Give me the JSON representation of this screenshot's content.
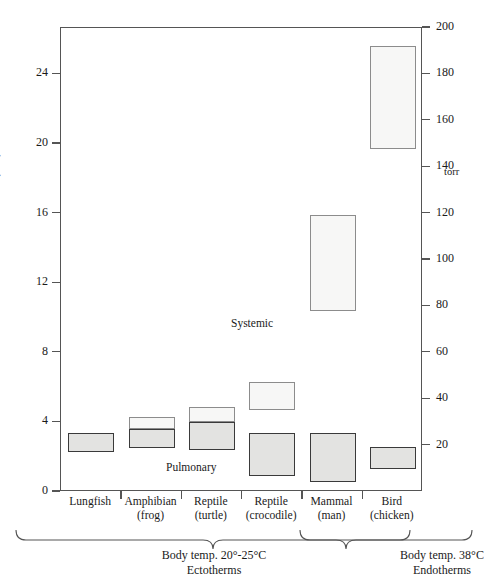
{
  "chart_data": {
    "type": "bar",
    "title": "",
    "ylabel": "Pressure (kPa)",
    "y2label": "torr",
    "xlabel": "",
    "ylim": [
      0,
      26.66
    ],
    "y2lim": [
      0,
      200
    ],
    "yticks": [
      0,
      4,
      8,
      12,
      16,
      20,
      24
    ],
    "y2ticks": [
      20,
      40,
      60,
      80,
      100,
      120,
      140,
      160,
      180,
      200
    ],
    "grid": false,
    "legend_position": "in-plot annotations",
    "annotations": [
      "Systemic",
      "Pulmonary"
    ],
    "categories": [
      "Lungfish",
      "Amphibian (frog)",
      "Reptile (turtle)",
      "Reptile (crocodile)",
      "Mammal (man)",
      "Bird (chicken)"
    ],
    "series": [
      {
        "name": "Pulmonary",
        "unit": "kPa",
        "ranges": [
          [
            2.3,
            3.4
          ],
          [
            2.5,
            3.6
          ],
          [
            2.4,
            4.0
          ],
          [
            0.9,
            3.4
          ],
          [
            0.6,
            3.4
          ],
          [
            1.3,
            2.6
          ]
        ]
      },
      {
        "name": "Systemic",
        "unit": "kPa",
        "ranges": [
          null,
          [
            3.6,
            4.3
          ],
          [
            4.0,
            4.9
          ],
          [
            4.7,
            6.3
          ],
          [
            10.4,
            15.9
          ],
          [
            19.7,
            25.6
          ]
        ]
      }
    ],
    "groups": [
      {
        "label_line1": "Body temp. 20°-25°C",
        "label_line2": "Ectotherms",
        "categories": [
          "Lungfish",
          "Amphibian (frog)",
          "Reptile (turtle)",
          "Reptile (crocodile)"
        ]
      },
      {
        "label_line1": "Body temp. 38°C",
        "label_line2": "Endotherms",
        "categories": [
          "Mammal (man)",
          "Bird (chicken)"
        ]
      }
    ]
  },
  "axes": {
    "y_title": "Pressure (kPa)",
    "right_unit": "torr",
    "left_ticks": [
      {
        "value": 24,
        "label": "24"
      },
      {
        "value": 20,
        "label": "20"
      },
      {
        "value": 16,
        "label": "16"
      },
      {
        "value": 12,
        "label": "12"
      },
      {
        "value": 8,
        "label": "8"
      },
      {
        "value": 4,
        "label": "4"
      },
      {
        "value": 0,
        "label": "0"
      }
    ],
    "right_ticks": [
      {
        "value": 200,
        "label": "200"
      },
      {
        "value": 180,
        "label": "180"
      },
      {
        "value": 160,
        "label": "160"
      },
      {
        "value": 140,
        "label": "140"
      },
      {
        "value": 120,
        "label": "120"
      },
      {
        "value": 100,
        "label": "100"
      },
      {
        "value": 80,
        "label": "80"
      },
      {
        "value": 60,
        "label": "60"
      },
      {
        "value": 40,
        "label": "40"
      },
      {
        "value": 20,
        "label": "20"
      }
    ]
  },
  "categories": [
    {
      "line1": "Lungfish",
      "line2": ""
    },
    {
      "line1": "Amphibian",
      "line2": "(frog)"
    },
    {
      "line1": "Reptile",
      "line2": "(turtle)"
    },
    {
      "line1": "Reptile",
      "line2": "(crocodile)"
    },
    {
      "line1": "Mammal",
      "line2": "(man)"
    },
    {
      "line1": "Bird",
      "line2": "(chicken)"
    }
  ],
  "annotations": {
    "systemic": "Systemic",
    "pulmonary": "Pulmonary"
  },
  "groups": {
    "ectotherms": {
      "line1": "Body temp. 20°-25°C",
      "line2": "Ectotherms"
    },
    "endotherms": {
      "line1": "Body temp. 38°C",
      "line2": "Endotherms"
    }
  },
  "colors": {
    "pulmonary_fill": "#e3e3e1",
    "pulmonary_stroke": "#3a3a3a",
    "systemic_fill": "#f7f7f6",
    "systemic_stroke": "#8c8c8c",
    "axis": "#555555",
    "text": "#1a1a1a"
  }
}
